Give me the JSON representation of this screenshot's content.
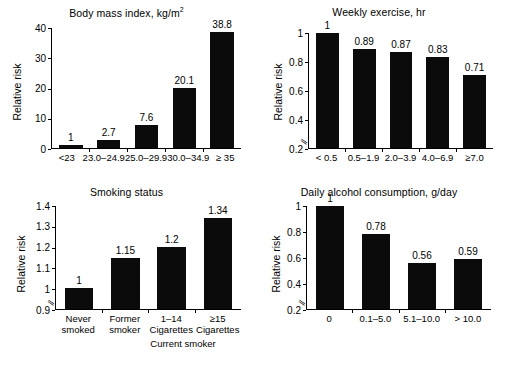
{
  "figure": {
    "ylabel": "Relative risk",
    "panel_count": 4
  },
  "chart_data": [
    {
      "type": "bar",
      "title": "Body mass index, kg/m",
      "title_sup": "2",
      "ylabel": "Relative risk",
      "xlabel": "",
      "categories": [
        "<23",
        "23.0–24.9",
        "25.0–29.9",
        "30.0–34.9",
        "≥ 35"
      ],
      "values": [
        1,
        2.7,
        7.6,
        20.1,
        38.8
      ],
      "value_labels": [
        "1",
        "2.7",
        "7.6",
        "20.1",
        "38.8"
      ],
      "ylim": [
        0,
        40
      ],
      "yticks": [
        0,
        10,
        20,
        30,
        40
      ],
      "ytick_labels": [
        "0",
        "10",
        "20",
        "30",
        "40"
      ],
      "axis_break": false,
      "grid": false,
      "legend": "none"
    },
    {
      "type": "bar",
      "title": "Weekly exercise, hr",
      "title_sup": "",
      "ylabel": "Relative risk",
      "xlabel": "",
      "categories": [
        "< 0.5",
        "0.5–1.9",
        "2.0–3.9",
        "4.0–6.9",
        "≥7.0"
      ],
      "values": [
        1,
        0.89,
        0.87,
        0.83,
        0.71
      ],
      "value_labels": [
        "1",
        "0.89",
        "0.87",
        "0.83",
        "0.71"
      ],
      "ylim": [
        0.2,
        1.0
      ],
      "yticks": [
        0.2,
        0.4,
        0.6,
        0.8,
        1.0
      ],
      "ytick_labels": [
        "0.2",
        "0.4",
        "0.6",
        "0.8",
        "1"
      ],
      "axis_break": true,
      "grid": false,
      "legend": "none"
    },
    {
      "type": "bar",
      "title": "Smoking status",
      "title_sup": "",
      "ylabel": "Relative risk",
      "xlabel": "Current smoker",
      "categories": [
        "Never smoked",
        "Former smoker",
        "1–14 Cigarettes",
        "≥15 Cigarettes"
      ],
      "category_lines": [
        [
          "Never",
          "smoked"
        ],
        [
          "Former",
          "smoker"
        ],
        [
          "1–14",
          "Cigarettes"
        ],
        [
          "≥15",
          "Cigarettes"
        ]
      ],
      "values": [
        1,
        1.15,
        1.2,
        1.34
      ],
      "value_labels": [
        "1",
        "1.15",
        "1.2",
        "1.34"
      ],
      "ylim": [
        0.9,
        1.4
      ],
      "yticks": [
        0.9,
        1.0,
        1.1,
        1.2,
        1.3,
        1.4
      ],
      "ytick_labels": [
        "0.9",
        "1",
        "1.1",
        "1.2",
        "1.3",
        "1.4"
      ],
      "axis_break": true,
      "grid": false,
      "legend": "none"
    },
    {
      "type": "bar",
      "title": "Daily alcohol consumption, g/day",
      "title_sup": "",
      "ylabel": "Relative risk",
      "xlabel": "",
      "categories": [
        "0",
        "0.1–5.0",
        "5.1–10.0",
        "> 10.0"
      ],
      "values": [
        1,
        0.78,
        0.56,
        0.59
      ],
      "value_labels": [
        "1",
        "0.78",
        "0.56",
        "0.59"
      ],
      "ylim": [
        0.2,
        1.0
      ],
      "yticks": [
        0.2,
        0.4,
        0.6,
        0.8,
        1.0
      ],
      "ytick_labels": [
        "0.2",
        "0.4",
        "0.6",
        "0.8",
        "1"
      ],
      "axis_break": true,
      "grid": false,
      "legend": "none"
    }
  ],
  "colors": {
    "bar": "#0b0b0b",
    "axis": "#000000",
    "background": "#ffffff"
  }
}
